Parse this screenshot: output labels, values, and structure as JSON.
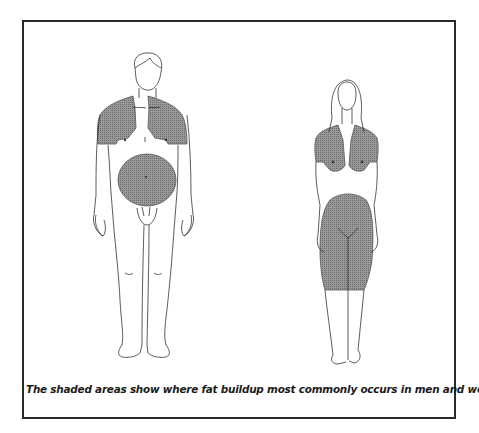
{
  "figure": {
    "caption": "The shaded areas show where fat buildup most commonly occurs in men and women.",
    "figures": [
      {
        "label": "man",
        "shaded_regions": [
          "shoulders",
          "upper-arms",
          "abdomen"
        ]
      },
      {
        "label": "woman",
        "shaded_regions": [
          "shoulders",
          "upper-arms",
          "chest",
          "hips",
          "thighs",
          "lower-abdomen"
        ]
      }
    ],
    "colors": {
      "frame": "#2a2a2a",
      "line": "#333333",
      "shade": "#8a8a8a",
      "background": "#ffffff"
    }
  }
}
